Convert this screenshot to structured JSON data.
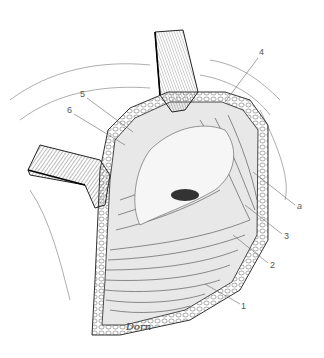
{
  "figure": {
    "type": "surgical anatomical illustration",
    "labels": [
      {
        "id": "label-1",
        "text": "1",
        "x": 241,
        "y": 306
      },
      {
        "id": "label-2",
        "text": "2",
        "x": 270,
        "y": 265
      },
      {
        "id": "label-3",
        "text": "3",
        "x": 284,
        "y": 236
      },
      {
        "id": "label-a",
        "text": "a",
        "x": 297,
        "y": 206
      },
      {
        "id": "label-4",
        "text": "4",
        "x": 260,
        "y": 52
      },
      {
        "id": "label-5",
        "text": "5",
        "x": 80,
        "y": 94
      },
      {
        "id": "label-6",
        "text": "6",
        "x": 67,
        "y": 110
      }
    ],
    "signature": "Dorn",
    "colors": {
      "ink": "#222222",
      "shade": "#888888",
      "paper": "#ffffff",
      "label": "#555555"
    }
  }
}
